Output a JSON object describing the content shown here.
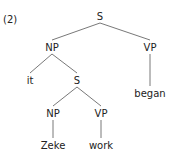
{
  "example_number": "(2)",
  "tree": {
    "nodes": [
      {
        "id": "s_root",
        "label": "S"
      },
      {
        "id": "np_main",
        "label": "NP"
      },
      {
        "id": "vp_main",
        "label": "VP"
      },
      {
        "id": "it",
        "label": "it"
      },
      {
        "id": "s_embedded",
        "label": "S"
      },
      {
        "id": "began",
        "label": "began"
      },
      {
        "id": "np_embedded",
        "label": "NP"
      },
      {
        "id": "vp_embedded",
        "label": "VP"
      },
      {
        "id": "zeke",
        "label": "Zeke"
      },
      {
        "id": "work",
        "label": "work"
      }
    ],
    "edges": [
      [
        "s_root",
        "np_main"
      ],
      [
        "s_root",
        "vp_main"
      ],
      [
        "np_main",
        "it"
      ],
      [
        "np_main",
        "s_embedded"
      ],
      [
        "vp_main",
        "began"
      ],
      [
        "s_embedded",
        "np_embedded"
      ],
      [
        "s_embedded",
        "vp_embedded"
      ],
      [
        "np_embedded",
        "zeke"
      ],
      [
        "vp_embedded",
        "work"
      ]
    ]
  }
}
